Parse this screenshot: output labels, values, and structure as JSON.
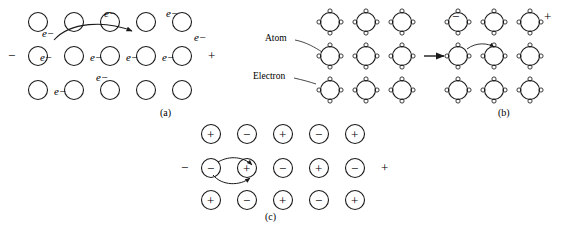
{
  "figure": {
    "title_hidden": "",
    "captions": [
      {
        "id": "a",
        "text": "(a)",
        "x": 168,
        "y": 110
      },
      {
        "id": "b",
        "text": "(b)",
        "x": 506,
        "y": 110
      },
      {
        "id": "c",
        "text": "(c)",
        "x": 272,
        "y": 214
      }
    ],
    "panels": {
      "a": {
        "name": "free-electron-metal-lattice",
        "minus_sign": "−",
        "plus_sign": "+",
        "electron_labels": [
          {
            "text": "e−",
            "x": 107,
            "y": 14
          },
          {
            "text": "e−",
            "x": 170,
            "y": 14
          },
          {
            "text": "e−",
            "x": 44,
            "y": 34
          },
          {
            "text": "e−",
            "x": 196,
            "y": 38
          },
          {
            "text": "e−",
            "x": 44,
            "y": 58
          },
          {
            "text": "e−",
            "x": 78,
            "y": 58
          },
          {
            "text": "e−",
            "x": 140,
            "y": 58
          },
          {
            "text": "e−",
            "x": 172,
            "y": 58
          },
          {
            "text": "e−",
            "x": 106,
            "y": 78
          },
          {
            "text": "e−",
            "x": 49,
            "y": 92
          }
        ],
        "atom_rows": [
          {
            "y": 22,
            "xs": [
              38,
              74,
              110,
              146,
              182
            ]
          },
          {
            "y": 56,
            "xs": [
              38,
              74,
              110,
              146,
              182
            ]
          },
          {
            "y": 90,
            "xs": [
              38,
              74,
              110,
              146,
              182
            ]
          }
        ]
      },
      "b": {
        "name": "bound-electron-lattice",
        "minus_sign": "−",
        "plus_sign": "+",
        "annotations": [
          {
            "text": "Atom",
            "x": 268,
            "y": 38
          },
          {
            "text": "Electron",
            "x": 257,
            "y": 76
          }
        ],
        "left_rows": [
          {
            "y": 22,
            "xs": [
              330,
              366,
              402
            ]
          },
          {
            "y": 56,
            "xs": [
              330,
              366,
              402
            ]
          },
          {
            "y": 90,
            "xs": [
              330,
              366,
              402
            ]
          }
        ],
        "right_rows": [
          {
            "y": 22,
            "xs": [
              458,
              494,
              530
            ]
          },
          {
            "y": 56,
            "xs": [
              458,
              494,
              530
            ]
          },
          {
            "y": 90,
            "xs": [
              458,
              494,
              530
            ]
          }
        ]
      },
      "c": {
        "name": "ionic-conduction-lattice",
        "minus_sign": "−",
        "plus_sign": "+",
        "charges": [
          [
            "+",
            "−",
            "+",
            "−",
            "+"
          ],
          [
            "−",
            "+",
            "−",
            "+",
            "−"
          ],
          [
            "+",
            "−",
            "+",
            "−",
            "+"
          ]
        ],
        "rows_y": [
          134,
          168,
          200
        ],
        "cols_x": [
          211,
          247,
          283,
          319,
          355
        ]
      }
    },
    "colors": {
      "stroke": "#1a1a1a",
      "background": "#ffffff"
    }
  }
}
